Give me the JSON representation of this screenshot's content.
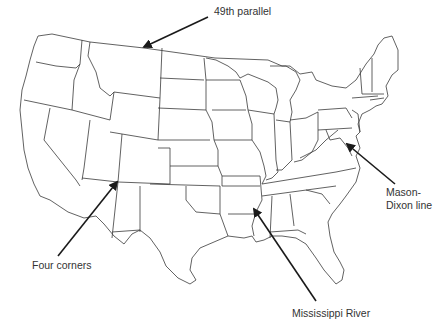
{
  "map": {
    "subject": "Outline map of the contiguous United States with state borders",
    "background": "#ffffff",
    "line_color": "#3a3a3a",
    "arrow_color": "#1a1a1a"
  },
  "annotations": [
    {
      "id": "49th-parallel",
      "label": "49th parallel",
      "label_pos": [
        214,
        5
      ],
      "arrow_from": [
        208,
        17
      ],
      "arrow_to": [
        144,
        47
      ]
    },
    {
      "id": "mason-dixon",
      "label_line1": "Mason-",
      "label_line2": "Dixon line",
      "label_pos": [
        386,
        186
      ],
      "arrow_from": [
        395,
        184
      ],
      "arrow_to": [
        347,
        144
      ]
    },
    {
      "id": "four-corners",
      "label": "Four corners",
      "label_pos": [
        32,
        259
      ],
      "arrow_from": [
        58,
        256
      ],
      "arrow_to": [
        117,
        182
      ]
    },
    {
      "id": "mississippi-river",
      "label": "Mississippi River",
      "label_pos": [
        292,
        307
      ],
      "arrow_from": [
        316,
        301
      ],
      "arrow_to": [
        254,
        209
      ]
    }
  ]
}
